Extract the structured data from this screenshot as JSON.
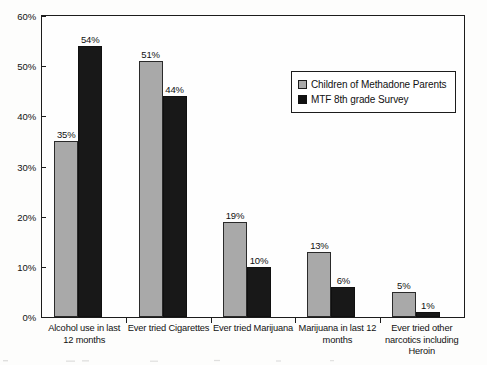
{
  "chart_data": {
    "type": "bar",
    "title": "",
    "xlabel": "",
    "ylabel": "",
    "ylim": [
      0,
      60
    ],
    "ytick_labels": [
      "0%",
      "10%",
      "20%",
      "30%",
      "40%",
      "50%",
      "60%"
    ],
    "ytick_values": [
      0,
      10,
      20,
      30,
      40,
      50,
      60
    ],
    "grid": false,
    "legend_position": "upper-right-inside",
    "categories": [
      "Alcohol use in last 12 months",
      "Ever tried Cigarettes",
      "Ever tried Marijuana",
      "Marijuana in last 12 months",
      "Ever tried other narcotics including Heroin"
    ],
    "category_lines": [
      [
        "Alcohol use in last",
        "12 months"
      ],
      [
        "Ever tried Cigarettes"
      ],
      [
        "Ever tried Marijuana"
      ],
      [
        "Marijuana in last 12",
        "months"
      ],
      [
        "Ever tried other",
        "narcotics including",
        "Heroin"
      ]
    ],
    "series": [
      {
        "name": "Children of Methadone Parents",
        "color": "#a9a9a9",
        "values": [
          35,
          51,
          19,
          13,
          5
        ],
        "labels": [
          "35%",
          "51%",
          "19%",
          "13%",
          "5%"
        ]
      },
      {
        "name": "MTF 8th grade Survey",
        "color": "#181818",
        "values": [
          54,
          44,
          10,
          6,
          1
        ],
        "labels": [
          "54%",
          "44%",
          "10%",
          "6%",
          "1%"
        ]
      }
    ]
  },
  "legend": {
    "entries": [
      {
        "label": "Children of Methadone Parents"
      },
      {
        "label": "MTF 8th grade Survey"
      }
    ]
  }
}
